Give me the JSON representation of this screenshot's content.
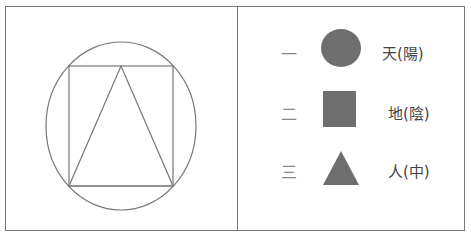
{
  "diagram": {
    "left_panel": {
      "figure": "circle enclosing a square enclosing a triangle",
      "stroke_color": "#777777"
    },
    "legend": [
      {
        "numeral": "一",
        "shape": "circle",
        "label": "天(陽)",
        "color": "#6e6e6e"
      },
      {
        "numeral": "二",
        "shape": "square",
        "label": "地(陰)",
        "color": "#6e6e6e"
      },
      {
        "numeral": "三",
        "shape": "triangle",
        "label": "人(中)",
        "color": "#6e6e6e"
      }
    ]
  }
}
